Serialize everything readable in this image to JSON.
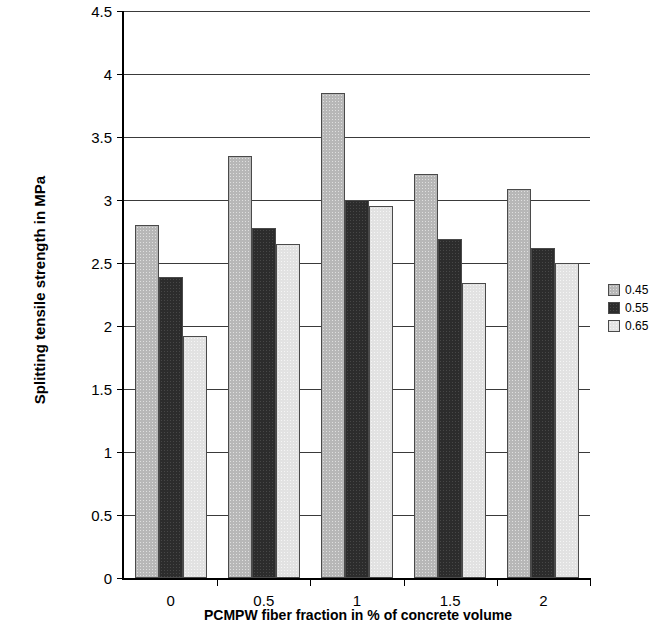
{
  "chart_data": {
    "type": "bar",
    "title": "",
    "xlabel": "PCMPW fiber fraction in % of concrete volume",
    "ylabel": "Splitting tensile strength in MPa",
    "categories": [
      "0",
      "0.5",
      "1",
      "1.5",
      "2"
    ],
    "series": [
      {
        "name": "0.45",
        "color": "#b7b7b7",
        "values": [
          2.8,
          3.35,
          3.85,
          3.21,
          3.09
        ]
      },
      {
        "name": "0.55",
        "color": "#2c2c2c",
        "values": [
          2.39,
          2.78,
          3.0,
          2.69,
          2.62
        ]
      },
      {
        "name": "0.65",
        "color": "#e2e2e2",
        "values": [
          1.92,
          2.65,
          2.95,
          2.34,
          2.5
        ]
      }
    ],
    "ylim": [
      0,
      4.5
    ],
    "yticks": [
      "0",
      "0.5",
      "1",
      "1.5",
      "2",
      "2.5",
      "3",
      "3.5",
      "4",
      "4.5"
    ],
    "ytick_values": [
      0,
      0.5,
      1,
      1.5,
      2,
      2.5,
      3,
      3.5,
      4,
      4.5
    ],
    "xticks": [
      "0",
      "0.5",
      "1",
      "1.5",
      "2"
    ],
    "grid": "horizontal",
    "legend_position": "right",
    "legend_entries": [
      "0.45",
      "0.55",
      "0.65"
    ]
  }
}
